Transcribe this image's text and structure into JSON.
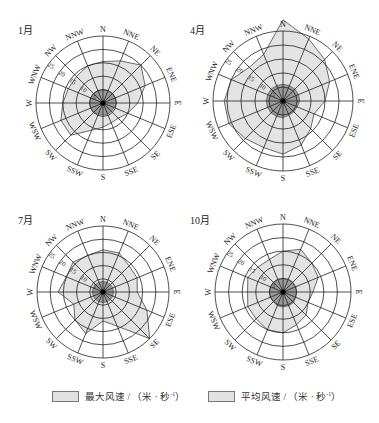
{
  "chart_data": [
    {
      "type": "radar",
      "title": "1月",
      "directions": [
        "N",
        "NNE",
        "NE",
        "ENE",
        "E",
        "ESE",
        "SE",
        "SSE",
        "S",
        "SSW",
        "SW",
        "WSW",
        "W",
        "WNW",
        "NW",
        "NNW"
      ],
      "radial_ticks": [
        5,
        10,
        15,
        20,
        25
      ],
      "rlim": [
        0,
        25
      ],
      "series": [
        {
          "name": "最大风速 / (米·秒⁻¹)",
          "values": [
            15.5,
            17,
            20,
            17,
            13,
            10,
            8,
            8,
            9,
            11,
            17,
            17,
            15,
            14,
            14,
            15
          ]
        },
        {
          "name": "平均风速 / (米·秒⁻¹)",
          "values": [
            5,
            5,
            5,
            5,
            5,
            4.5,
            4.5,
            4.5,
            4.5,
            4.5,
            5,
            5,
            5,
            5,
            5,
            5
          ]
        }
      ]
    },
    {
      "type": "radar",
      "title": "4月",
      "directions": [
        "N",
        "NNE",
        "NE",
        "ENE",
        "E",
        "ESE",
        "SE",
        "SSE",
        "S",
        "SSW",
        "SW",
        "WSW",
        "W",
        "WNW",
        "NW",
        "NNW"
      ],
      "radial_ticks": [
        5,
        10,
        15,
        20,
        25
      ],
      "rlim": [
        0,
        25
      ],
      "series": [
        {
          "name": "最大风速 / (米·秒⁻¹)",
          "values": [
            29,
            24,
            21,
            18,
            15,
            12,
            14,
            17,
            19,
            18,
            19,
            21,
            21,
            20,
            17,
            18
          ]
        },
        {
          "name": "平均风速 / (米·秒⁻¹)",
          "values": [
            6,
            6,
            6,
            6,
            6,
            5.5,
            5.5,
            5.5,
            6,
            6,
            6,
            6,
            6,
            6,
            6,
            6
          ]
        }
      ]
    },
    {
      "type": "radar",
      "title": "7月",
      "directions": [
        "N",
        "NNE",
        "NE",
        "ENE",
        "E",
        "ESE",
        "SE",
        "SSE",
        "S",
        "SSW",
        "SW",
        "WSW",
        "W",
        "WNW",
        "NW",
        "NNW"
      ],
      "radial_ticks": [
        5,
        10,
        15,
        20,
        25
      ],
      "rlim": [
        0,
        25
      ],
      "series": [
        {
          "name": "最大风速 / (米·秒⁻¹)",
          "values": [
            16,
            16,
            14,
            14,
            13,
            18,
            25,
            14,
            11,
            17,
            15,
            12,
            17,
            15,
            16,
            15
          ]
        },
        {
          "name": "平均风速 / (米·秒⁻¹)",
          "values": [
            4,
            4,
            4,
            4,
            4,
            4,
            4,
            4,
            4,
            4,
            4,
            4,
            4,
            4,
            4,
            4
          ]
        }
      ]
    },
    {
      "type": "radar",
      "title": "10月",
      "directions": [
        "N",
        "NNE",
        "NE",
        "ENE",
        "E",
        "ESE",
        "SE",
        "SSE",
        "S",
        "SSW",
        "SW",
        "WSW",
        "W",
        "WNW",
        "NW",
        "NNW"
      ],
      "radial_ticks": [
        5,
        10,
        15,
        20,
        25
      ],
      "rlim": [
        0,
        25
      ],
      "series": [
        {
          "name": "最大风速 / (米·秒⁻¹)",
          "values": [
            15,
            17,
            15,
            14,
            11,
            10,
            12,
            13,
            15,
            15,
            14,
            14,
            13,
            14,
            13,
            13
          ]
        },
        {
          "name": "平均风速 / (米·秒⁻¹)",
          "values": [
            5,
            5,
            5,
            5,
            5,
            5,
            5.5,
            5.5,
            5.5,
            5.5,
            5,
            5,
            5,
            5,
            5,
            5
          ]
        }
      ]
    }
  ],
  "panels": [
    {
      "label": "1月",
      "cx": 103,
      "cy": 103,
      "r": 67
    },
    {
      "label": "4月",
      "cx": 283,
      "cy": 101,
      "r": 70
    },
    {
      "label": "7月",
      "cx": 103,
      "cy": 292,
      "r": 66
    },
    {
      "label": "10月",
      "cx": 283,
      "cy": 292,
      "r": 68
    }
  ],
  "colors": {
    "max_fill": "#e3e3e3",
    "avg_fill": "#9a9a9a",
    "grid": "#222222"
  },
  "legend": {
    "max_label_prefix": "最大风速 / （米 · 秒",
    "avg_label_prefix": "平均风速 / （米 · 秒",
    "unit_exp": "-1",
    "suffix": "）"
  }
}
